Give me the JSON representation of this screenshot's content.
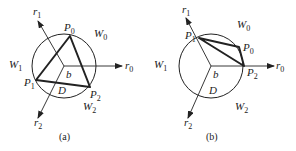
{
  "figures": [
    {
      "id": "a",
      "caption": "(a)",
      "regions": [
        {
          "name": "W",
          "sub": "0"
        },
        {
          "name": "W",
          "sub": "1"
        },
        {
          "name": "W",
          "sub": "2"
        }
      ],
      "rays": [
        {
          "name": "r",
          "sub": "0"
        },
        {
          "name": "r",
          "sub": "1"
        },
        {
          "name": "r",
          "sub": "2"
        }
      ],
      "points": [
        {
          "name": "P",
          "sub": "0"
        },
        {
          "name": "P",
          "sub": "1"
        },
        {
          "name": "P",
          "sub": "2"
        }
      ],
      "center_label": "b",
      "disk_label": "D"
    },
    {
      "id": "b",
      "caption": "(b)",
      "regions": [
        {
          "name": "W",
          "sub": "0"
        },
        {
          "name": "W",
          "sub": "1"
        },
        {
          "name": "W",
          "sub": "2"
        }
      ],
      "rays": [
        {
          "name": "r",
          "sub": "0"
        },
        {
          "name": "r",
          "sub": "1"
        },
        {
          "name": "r",
          "sub": "2"
        }
      ],
      "points": [
        {
          "name": "P",
          "sub": "0"
        },
        {
          "name": "P",
          "sub": "1"
        },
        {
          "name": "P",
          "sub": "2"
        }
      ],
      "center_label": "b",
      "disk_label": "D"
    }
  ],
  "colors": {
    "stroke": "#222222",
    "background": "#ffffff"
  }
}
